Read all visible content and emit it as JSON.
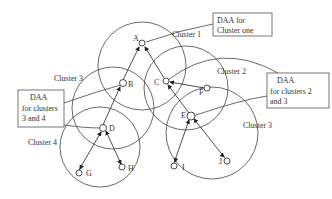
{
  "diagram": {
    "clusters": [
      {
        "label": "Cluster 1",
        "cx": 142,
        "cy": 66,
        "r": 44,
        "label_x": 172,
        "label_y": 37
      },
      {
        "label": "Cluster 2",
        "cx": 186,
        "cy": 88,
        "r": 42,
        "label_x": 217,
        "label_y": 74
      },
      {
        "label": "Cluster 3",
        "cx": 113,
        "cy": 108,
        "r": 41,
        "label_x": 54,
        "label_y": 81
      },
      {
        "label": "Cluster 3",
        "cx": 212,
        "cy": 133,
        "r": 46,
        "label_x": 243,
        "label_y": 128
      },
      {
        "label": "Cluster 4",
        "cx": 100,
        "cy": 147,
        "r": 40,
        "label_x": 28,
        "label_y": 145
      }
    ],
    "nodes": [
      {
        "id": "A",
        "x": 142,
        "y": 43
      },
      {
        "id": "B",
        "x": 123,
        "y": 83
      },
      {
        "id": "C",
        "x": 166,
        "y": 81
      },
      {
        "id": "F",
        "x": 207,
        "y": 88
      },
      {
        "id": "D",
        "x": 103,
        "y": 128
      },
      {
        "id": "E",
        "x": 191,
        "y": 116
      },
      {
        "id": "G",
        "x": 79,
        "y": 173
      },
      {
        "id": "H",
        "x": 122,
        "y": 167
      },
      {
        "id": "I",
        "x": 174,
        "y": 166
      },
      {
        "id": "J",
        "x": 227,
        "y": 161
      }
    ],
    "edges": [
      [
        "B",
        "A"
      ],
      [
        "C",
        "A"
      ],
      [
        "D",
        "B"
      ],
      [
        "E",
        "C"
      ],
      [
        "F",
        "C"
      ],
      [
        "G",
        "D"
      ],
      [
        "H",
        "D"
      ],
      [
        "I",
        "E"
      ],
      [
        "J",
        "E"
      ]
    ],
    "callouts": [
      {
        "lines": [
          "DAA for",
          "Cluster one"
        ],
        "x": 213,
        "y": 13,
        "w": 59,
        "h": 23
      },
      {
        "lines": [
          "DAA",
          "for clusters 2",
          "and 3"
        ],
        "x": 267,
        "y": 73,
        "w": 62,
        "h": 35
      },
      {
        "lines": [
          "DAA",
          "for clusters",
          "3 and 4"
        ],
        "x": 18,
        "y": 90,
        "w": 46,
        "h": 37
      }
    ]
  }
}
